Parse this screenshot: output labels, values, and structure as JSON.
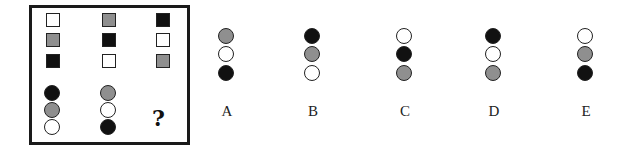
{
  "puzzle": {
    "matrix": {
      "squares": [
        [
          "white",
          "gray",
          "black"
        ],
        [
          "gray",
          "black",
          "white"
        ],
        [
          "black",
          "white",
          "gray"
        ]
      ],
      "circles": [
        [
          "black",
          "gray",
          "white"
        ],
        [
          "gray",
          "white",
          "black"
        ]
      ],
      "missing_label": "?"
    },
    "options": [
      {
        "label": "A",
        "circles": [
          "gray",
          "white",
          "black"
        ]
      },
      {
        "label": "B",
        "circles": [
          "black",
          "gray",
          "white"
        ]
      },
      {
        "label": "C",
        "circles": [
          "white",
          "black",
          "gray"
        ]
      },
      {
        "label": "D",
        "circles": [
          "black",
          "white",
          "gray"
        ]
      },
      {
        "label": "E",
        "circles": [
          "white",
          "gray",
          "black"
        ]
      }
    ],
    "colors": {
      "white": "#ffffff",
      "gray": "#8f8f8f",
      "black": "#111111"
    }
  }
}
